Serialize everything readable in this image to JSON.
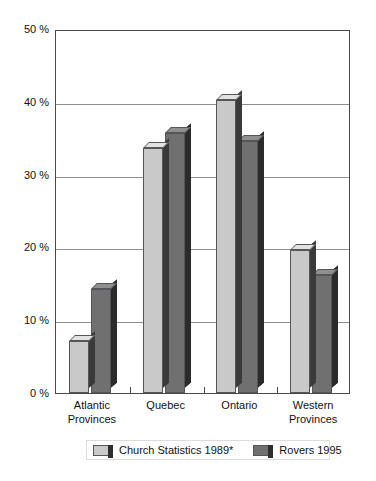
{
  "title_faint": "",
  "chart_data": {
    "type": "bar",
    "title": "",
    "subtitle": "",
    "xlabel": "",
    "ylabel": "",
    "ylim": [
      0,
      50
    ],
    "ytick_values": [
      0,
      10,
      20,
      30,
      40,
      50
    ],
    "ytick_labels": [
      "0 %",
      "10 %",
      "20 %",
      "30 %",
      "40 %",
      "50 %"
    ],
    "grid": "horizontal",
    "legend_position": "bottom",
    "categories": [
      "Atlantic Provinces",
      "Quebec",
      "Ontario",
      "Western Provinces"
    ],
    "category_lines": [
      [
        "Atlantic",
        "Provinces"
      ],
      [
        "Quebec",
        ""
      ],
      [
        "Ontario",
        ""
      ],
      [
        "Western",
        "Provinces"
      ]
    ],
    "series": [
      {
        "name": "Church Statistics 1989*",
        "color": "#c9c9c9",
        "values": [
          7.2,
          33.7,
          40.3,
          19.6
        ]
      },
      {
        "name": "Rovers 1995",
        "color": "#707070",
        "values": [
          14.3,
          35.7,
          34.6,
          16.2
        ]
      }
    ]
  },
  "legend": {
    "items": [
      {
        "label": "Church Statistics 1989*",
        "swatch": "light"
      },
      {
        "label": "Rovers 1995",
        "swatch": "dark"
      }
    ]
  },
  "colors": {
    "series_light": "#c9c9c9",
    "series_dark": "#707070",
    "axis": "#4a4a4a",
    "grid": "#8e8e8e",
    "background": "#ffffff"
  }
}
